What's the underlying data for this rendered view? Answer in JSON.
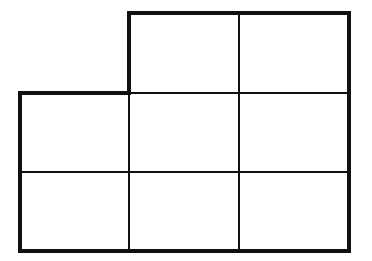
{
  "diagram": {
    "colors": {
      "background": "#ffffff",
      "stroke": "#111111"
    },
    "outline": {
      "points": [
        [
          129,
          13
        ],
        [
          349,
          13
        ],
        [
          349,
          251
        ],
        [
          20,
          251
        ],
        [
          20,
          93
        ],
        [
          129,
          93
        ]
      ],
      "stroke_width": 4
    },
    "grid_lines": {
      "stroke_width": 2,
      "lines": [
        {
          "x1": 129,
          "y1": 93,
          "x2": 129,
          "y2": 251
        },
        {
          "x1": 239,
          "y1": 13,
          "x2": 239,
          "y2": 251
        },
        {
          "x1": 129,
          "y1": 93,
          "x2": 349,
          "y2": 93
        },
        {
          "x1": 20,
          "y1": 172,
          "x2": 349,
          "y2": 172
        }
      ]
    },
    "cells": [
      {
        "row": 0,
        "col": 1
      },
      {
        "row": 0,
        "col": 2
      },
      {
        "row": 1,
        "col": 0
      },
      {
        "row": 1,
        "col": 1
      },
      {
        "row": 1,
        "col": 2
      },
      {
        "row": 2,
        "col": 0
      },
      {
        "row": 2,
        "col": 1
      },
      {
        "row": 2,
        "col": 2
      }
    ]
  }
}
